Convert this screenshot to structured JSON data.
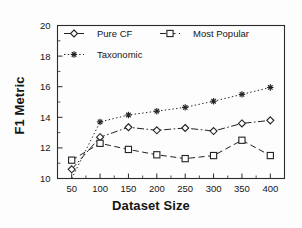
{
  "chart_data": {
    "type": "line",
    "title": "",
    "xlabel": "Dataset Size",
    "ylabel": "F1 Metric",
    "x": [
      50,
      100,
      150,
      200,
      250,
      300,
      350,
      400
    ],
    "xticks": [
      "50",
      "100",
      "150",
      "200",
      "250",
      "300",
      "350",
      "400"
    ],
    "yticks": [
      "10",
      "12",
      "14",
      "16",
      "18",
      "20"
    ],
    "xlim": [
      25,
      425
    ],
    "ylim": [
      10,
      20
    ],
    "grid": false,
    "legend_position": "upper-left-inside",
    "series": [
      {
        "name": "Pure CF",
        "marker": "diamond",
        "linestyle": "dash-dot",
        "values": [
          10.6,
          12.7,
          13.35,
          13.15,
          13.3,
          13.1,
          13.6,
          13.8
        ]
      },
      {
        "name": "Most Popular",
        "marker": "square",
        "linestyle": "dashed",
        "values": [
          11.2,
          12.3,
          11.9,
          11.55,
          11.3,
          11.5,
          12.5,
          11.5
        ]
      },
      {
        "name": "Taxonomic",
        "marker": "star",
        "linestyle": "dotted",
        "values": [
          10.0,
          13.7,
          14.15,
          14.4,
          14.65,
          15.05,
          15.5,
          15.95
        ]
      }
    ]
  },
  "legend": {
    "entries": [
      {
        "label": "Pure CF"
      },
      {
        "label": "Most Popular"
      },
      {
        "label": "Taxonomic"
      }
    ]
  },
  "colors": {
    "ink": "#222222",
    "background": "#fdfdfd"
  }
}
